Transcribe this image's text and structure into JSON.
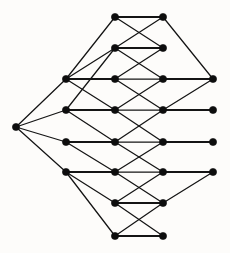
{
  "diagram": {
    "type": "undirected-graph",
    "background_color": "#fdfcfa",
    "edge_color": "#141414",
    "node_color": "#0d0d0d",
    "node_radius": 3.6,
    "width": 230,
    "height": 253,
    "node_count": 19,
    "edge_count": 40,
    "columns": [
      16,
      66,
      115,
      163,
      213
    ],
    "rows": [
      17,
      48,
      79,
      110,
      142,
      172,
      203,
      236
    ],
    "nodes": [
      {
        "id": "apex",
        "label": "apex",
        "x": 16,
        "y": 127
      },
      {
        "id": "t1",
        "label": "t1",
        "x": 115,
        "y": 17
      },
      {
        "id": "t2",
        "label": "t2",
        "x": 163,
        "y": 17
      },
      {
        "id": "s1",
        "label": "s1",
        "x": 115,
        "y": 48
      },
      {
        "id": "s2",
        "label": "s2",
        "x": 163,
        "y": 48
      },
      {
        "id": "L1",
        "label": "L1",
        "x": 66,
        "y": 79
      },
      {
        "id": "M1",
        "label": "M1",
        "x": 115,
        "y": 79
      },
      {
        "id": "N1",
        "label": "N1",
        "x": 163,
        "y": 79
      },
      {
        "id": "R1",
        "label": "R1",
        "x": 213,
        "y": 79
      },
      {
        "id": "L2",
        "label": "L2",
        "x": 66,
        "y": 110
      },
      {
        "id": "M2",
        "label": "M2",
        "x": 115,
        "y": 110
      },
      {
        "id": "N2",
        "label": "N2",
        "x": 163,
        "y": 110
      },
      {
        "id": "R2",
        "label": "R2",
        "x": 213,
        "y": 110
      },
      {
        "id": "L3",
        "label": "L3",
        "x": 66,
        "y": 142
      },
      {
        "id": "M3",
        "label": "M3",
        "x": 115,
        "y": 142
      },
      {
        "id": "N3",
        "label": "N3",
        "x": 163,
        "y": 142
      },
      {
        "id": "R3",
        "label": "R3",
        "x": 213,
        "y": 142
      },
      {
        "id": "L4",
        "label": "L4",
        "x": 66,
        "y": 172
      },
      {
        "id": "M4",
        "label": "M4",
        "x": 115,
        "y": 172
      },
      {
        "id": "N4",
        "label": "N4",
        "x": 163,
        "y": 172
      },
      {
        "id": "R4",
        "label": "R4",
        "x": 213,
        "y": 172
      },
      {
        "id": "b1",
        "label": "b1",
        "x": 115,
        "y": 203
      },
      {
        "id": "b2",
        "label": "b2",
        "x": 163,
        "y": 203
      },
      {
        "id": "z1",
        "label": "z1",
        "x": 115,
        "y": 236
      },
      {
        "id": "z2",
        "label": "z2",
        "x": 163,
        "y": 236
      }
    ],
    "edges": [
      {
        "from": "apex",
        "to": "L1",
        "kind": "diagonal"
      },
      {
        "from": "apex",
        "to": "L2",
        "kind": "diagonal"
      },
      {
        "from": "apex",
        "to": "L3",
        "kind": "diagonal"
      },
      {
        "from": "apex",
        "to": "L4",
        "kind": "diagonal"
      },
      {
        "from": "t1",
        "to": "t2",
        "kind": "horizontal"
      },
      {
        "from": "t1",
        "to": "L1",
        "kind": "diagonal"
      },
      {
        "from": "t1",
        "to": "s2",
        "kind": "diagonal"
      },
      {
        "from": "t2",
        "to": "s1",
        "kind": "diagonal"
      },
      {
        "from": "t2",
        "to": "R1",
        "kind": "diagonal"
      },
      {
        "from": "s1",
        "to": "s2",
        "kind": "horizontal"
      },
      {
        "from": "s1",
        "to": "L1",
        "kind": "diagonal"
      },
      {
        "from": "s1",
        "to": "L2",
        "kind": "diagonal"
      },
      {
        "from": "s1",
        "to": "N1",
        "kind": "diagonal"
      },
      {
        "from": "s2",
        "to": "M1",
        "kind": "diagonal"
      },
      {
        "from": "L1",
        "to": "M1",
        "kind": "horizontal"
      },
      {
        "from": "M1",
        "to": "N1",
        "kind": "diagonal"
      },
      {
        "from": "N1",
        "to": "R1",
        "kind": "horizontal"
      },
      {
        "from": "M1",
        "to": "N2",
        "kind": "diagonal"
      },
      {
        "from": "N1",
        "to": "M2",
        "kind": "diagonal"
      },
      {
        "from": "L1",
        "to": "M2",
        "kind": "diagonal"
      },
      {
        "from": "R1",
        "to": "N2",
        "kind": "diagonal"
      },
      {
        "from": "L2",
        "to": "M2",
        "kind": "horizontal"
      },
      {
        "from": "M2",
        "to": "N2",
        "kind": "diagonal"
      },
      {
        "from": "N2",
        "to": "R2",
        "kind": "horizontal"
      },
      {
        "from": "L2",
        "to": "M3",
        "kind": "diagonal"
      },
      {
        "from": "M2",
        "to": "N3",
        "kind": "diagonal"
      },
      {
        "from": "N2",
        "to": "M3",
        "kind": "diagonal"
      },
      {
        "from": "L3",
        "to": "M3",
        "kind": "horizontal"
      },
      {
        "from": "M3",
        "to": "N3",
        "kind": "diagonal"
      },
      {
        "from": "N3",
        "to": "R3",
        "kind": "horizontal"
      },
      {
        "from": "L3",
        "to": "M4",
        "kind": "diagonal"
      },
      {
        "from": "M3",
        "to": "N4",
        "kind": "diagonal"
      },
      {
        "from": "N3",
        "to": "M4",
        "kind": "diagonal"
      },
      {
        "from": "L4",
        "to": "M4",
        "kind": "horizontal"
      },
      {
        "from": "M4",
        "to": "N4",
        "kind": "diagonal"
      },
      {
        "from": "N4",
        "to": "R4",
        "kind": "horizontal"
      },
      {
        "from": "L4",
        "to": "b1",
        "kind": "diagonal"
      },
      {
        "from": "L4",
        "to": "z1",
        "kind": "diagonal"
      },
      {
        "from": "M4",
        "to": "b2",
        "kind": "diagonal"
      },
      {
        "from": "N4",
        "to": "b1",
        "kind": "diagonal"
      },
      {
        "from": "R4",
        "to": "b2",
        "kind": "diagonal"
      },
      {
        "from": "b1",
        "to": "b2",
        "kind": "horizontal"
      },
      {
        "from": "b1",
        "to": "z2",
        "kind": "diagonal"
      },
      {
        "from": "b2",
        "to": "z1",
        "kind": "diagonal"
      },
      {
        "from": "z1",
        "to": "z2",
        "kind": "horizontal"
      }
    ]
  }
}
